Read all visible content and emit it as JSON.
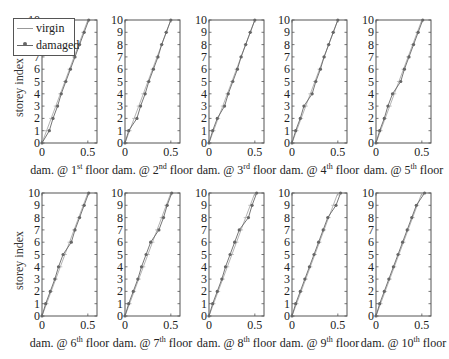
{
  "chart_data": [
    {
      "type": "line",
      "title": "",
      "xlabel": "dam. @ 1st floor",
      "xlabel_base": "dam. @ 1",
      "xlabel_sup": "st",
      "xlabel_tail": " floor",
      "ylabel": "storey index",
      "xlim": [
        0,
        0.6
      ],
      "ylim": [
        0,
        10
      ],
      "xticks": [
        "0",
        "0.5"
      ],
      "yticks": [
        "0",
        "1",
        "2",
        "3",
        "4",
        "5",
        "6",
        "7",
        "8",
        "9",
        "10"
      ],
      "series": [
        {
          "name": "virgin",
          "x": [
            0,
            0.05,
            0.1,
            0.15,
            0.2,
            0.25,
            0.3,
            0.35,
            0.4,
            0.45,
            0.5
          ],
          "y": [
            0,
            1,
            2,
            3,
            4,
            5,
            6,
            7,
            8,
            9,
            10
          ]
        },
        {
          "name": "damaged",
          "x": [
            0,
            0.08,
            0.12,
            0.17,
            0.21,
            0.26,
            0.31,
            0.36,
            0.41,
            0.46,
            0.51
          ],
          "y": [
            0,
            1,
            2,
            3,
            4,
            5,
            6,
            7,
            8,
            9,
            10
          ]
        }
      ]
    },
    {
      "type": "line",
      "xlabel": "dam. @ 2nd floor",
      "xlabel_base": "dam. @ 2",
      "xlabel_sup": "nd",
      "xlabel_tail": " floor",
      "ylabel": "",
      "xlim": [
        0,
        0.6
      ],
      "ylim": [
        0,
        10
      ],
      "xticks": [
        "0",
        "0.5"
      ],
      "yticks": [
        "0",
        "1",
        "2",
        "3",
        "4",
        "5",
        "6",
        "7",
        "8",
        "9",
        "10"
      ],
      "series": [
        {
          "name": "virgin",
          "x": [
            0,
            0.05,
            0.1,
            0.15,
            0.2,
            0.25,
            0.3,
            0.35,
            0.4,
            0.45,
            0.5
          ],
          "y": [
            0,
            1,
            2,
            3,
            4,
            5,
            6,
            7,
            8,
            9,
            10
          ]
        },
        {
          "name": "damaged",
          "x": [
            0,
            0.04,
            0.13,
            0.17,
            0.22,
            0.26,
            0.31,
            0.36,
            0.4,
            0.45,
            0.5
          ],
          "y": [
            0,
            1,
            2,
            3,
            4,
            5,
            6,
            7,
            8,
            9,
            10
          ]
        }
      ]
    },
    {
      "type": "line",
      "xlabel": "dam. @ 3rd floor",
      "xlabel_base": "dam. @ 3",
      "xlabel_sup": "rd",
      "xlabel_tail": " floor",
      "ylabel": "",
      "xlim": [
        0,
        0.6
      ],
      "ylim": [
        0,
        10
      ],
      "xticks": [
        "0",
        "0.5"
      ],
      "yticks": [
        "0",
        "1",
        "2",
        "3",
        "4",
        "5",
        "6",
        "7",
        "8",
        "9",
        "10"
      ],
      "series": [
        {
          "name": "virgin",
          "x": [
            0,
            0.05,
            0.1,
            0.15,
            0.2,
            0.25,
            0.3,
            0.35,
            0.4,
            0.45,
            0.5
          ],
          "y": [
            0,
            1,
            2,
            3,
            4,
            5,
            6,
            7,
            8,
            9,
            10
          ]
        },
        {
          "name": "damaged",
          "x": [
            0,
            0.04,
            0.09,
            0.17,
            0.21,
            0.26,
            0.31,
            0.35,
            0.4,
            0.45,
            0.5
          ],
          "y": [
            0,
            1,
            2,
            3,
            4,
            5,
            6,
            7,
            8,
            9,
            10
          ]
        }
      ]
    },
    {
      "type": "line",
      "xlabel": "dam. @ 4th floor",
      "xlabel_base": "dam. @ 4",
      "xlabel_sup": "th",
      "xlabel_tail": " floor",
      "ylabel": "",
      "xlim": [
        0,
        0.6
      ],
      "ylim": [
        0,
        10
      ],
      "xticks": [
        "0",
        "0.5"
      ],
      "yticks": [
        "0",
        "1",
        "2",
        "3",
        "4",
        "5",
        "6",
        "7",
        "8",
        "9",
        "10"
      ],
      "series": [
        {
          "name": "virgin",
          "x": [
            0,
            0.05,
            0.1,
            0.15,
            0.2,
            0.25,
            0.3,
            0.35,
            0.4,
            0.45,
            0.5
          ],
          "y": [
            0,
            1,
            2,
            3,
            4,
            5,
            6,
            7,
            8,
            9,
            10
          ]
        },
        {
          "name": "damaged",
          "x": [
            0,
            0.04,
            0.09,
            0.13,
            0.22,
            0.26,
            0.31,
            0.35,
            0.4,
            0.45,
            0.5
          ],
          "y": [
            0,
            1,
            2,
            3,
            4,
            5,
            6,
            7,
            8,
            9,
            10
          ]
        }
      ]
    },
    {
      "type": "line",
      "xlabel": "dam. @ 5th floor",
      "xlabel_base": "dam. @ 5",
      "xlabel_sup": "th",
      "xlabel_tail": " floor",
      "ylabel": "",
      "xlim": [
        0,
        0.6
      ],
      "ylim": [
        0,
        10
      ],
      "xticks": [
        "0",
        "0.5"
      ],
      "yticks": [
        "0",
        "1",
        "2",
        "3",
        "4",
        "5",
        "6",
        "7",
        "8",
        "9",
        "10"
      ],
      "series": [
        {
          "name": "virgin",
          "x": [
            0,
            0.05,
            0.1,
            0.15,
            0.2,
            0.25,
            0.3,
            0.35,
            0.4,
            0.45,
            0.5
          ],
          "y": [
            0,
            1,
            2,
            3,
            4,
            5,
            6,
            7,
            8,
            9,
            10
          ]
        },
        {
          "name": "damaged",
          "x": [
            0,
            0.04,
            0.09,
            0.13,
            0.18,
            0.27,
            0.31,
            0.36,
            0.41,
            0.46,
            0.51
          ],
          "y": [
            0,
            1,
            2,
            3,
            4,
            5,
            6,
            7,
            8,
            9,
            10
          ]
        }
      ]
    },
    {
      "type": "line",
      "xlabel": "dam. @ 6th floor",
      "xlabel_base": "dam. @ 6",
      "xlabel_sup": "th",
      "xlabel_tail": " floor",
      "ylabel": "storey index",
      "xlim": [
        0,
        0.6
      ],
      "ylim": [
        0,
        10
      ],
      "xticks": [
        "0",
        "0.5"
      ],
      "yticks": [
        "0",
        "1",
        "2",
        "3",
        "4",
        "5",
        "6",
        "7",
        "8",
        "9",
        "10"
      ],
      "series": [
        {
          "name": "virgin",
          "x": [
            0,
            0.05,
            0.1,
            0.15,
            0.2,
            0.25,
            0.3,
            0.35,
            0.4,
            0.45,
            0.5
          ],
          "y": [
            0,
            1,
            2,
            3,
            4,
            5,
            6,
            7,
            8,
            9,
            10
          ]
        },
        {
          "name": "damaged",
          "x": [
            0,
            0.04,
            0.09,
            0.14,
            0.18,
            0.23,
            0.32,
            0.36,
            0.41,
            0.46,
            0.51
          ],
          "y": [
            0,
            1,
            2,
            3,
            4,
            5,
            6,
            7,
            8,
            9,
            10
          ]
        }
      ]
    },
    {
      "type": "line",
      "xlabel": "dam. @ 7th floor",
      "xlabel_base": "dam. @ 7",
      "xlabel_sup": "th",
      "xlabel_tail": " floor",
      "ylabel": "",
      "xlim": [
        0,
        0.6
      ],
      "ylim": [
        0,
        10
      ],
      "xticks": [
        "0",
        "0.5"
      ],
      "yticks": [
        "0",
        "1",
        "2",
        "3",
        "4",
        "5",
        "6",
        "7",
        "8",
        "9",
        "10"
      ],
      "series": [
        {
          "name": "virgin",
          "x": [
            0,
            0.05,
            0.1,
            0.15,
            0.2,
            0.25,
            0.3,
            0.35,
            0.4,
            0.45,
            0.5
          ],
          "y": [
            0,
            1,
            2,
            3,
            4,
            5,
            6,
            7,
            8,
            9,
            10
          ]
        },
        {
          "name": "damaged",
          "x": [
            0,
            0.04,
            0.09,
            0.14,
            0.18,
            0.23,
            0.28,
            0.37,
            0.42,
            0.46,
            0.51
          ],
          "y": [
            0,
            1,
            2,
            3,
            4,
            5,
            6,
            7,
            8,
            9,
            10
          ]
        }
      ]
    },
    {
      "type": "line",
      "xlabel": "dam. @ 8th floor",
      "xlabel_base": "dam. @ 8",
      "xlabel_sup": "th",
      "xlabel_tail": " floor",
      "ylabel": "",
      "xlim": [
        0,
        0.6
      ],
      "ylim": [
        0,
        10
      ],
      "xticks": [
        "0",
        "0.5"
      ],
      "yticks": [
        "0",
        "1",
        "2",
        "3",
        "4",
        "5",
        "6",
        "7",
        "8",
        "9",
        "10"
      ],
      "series": [
        {
          "name": "virgin",
          "x": [
            0,
            0.05,
            0.1,
            0.15,
            0.2,
            0.25,
            0.3,
            0.35,
            0.4,
            0.45,
            0.5
          ],
          "y": [
            0,
            1,
            2,
            3,
            4,
            5,
            6,
            7,
            8,
            9,
            10
          ]
        },
        {
          "name": "damaged",
          "x": [
            0,
            0.04,
            0.09,
            0.14,
            0.18,
            0.23,
            0.28,
            0.33,
            0.43,
            0.47,
            0.52
          ],
          "y": [
            0,
            1,
            2,
            3,
            4,
            5,
            6,
            7,
            8,
            9,
            10
          ]
        }
      ]
    },
    {
      "type": "line",
      "xlabel": "dam. @ 9th floor",
      "xlabel_base": "dam. @ 9",
      "xlabel_sup": "th",
      "xlabel_tail": " floor",
      "ylabel": "",
      "xlim": [
        0,
        0.6
      ],
      "ylim": [
        0,
        10
      ],
      "xticks": [
        "0",
        "0.5"
      ],
      "yticks": [
        "0",
        "1",
        "2",
        "3",
        "4",
        "5",
        "6",
        "7",
        "8",
        "9",
        "10"
      ],
      "series": [
        {
          "name": "virgin",
          "x": [
            0,
            0.05,
            0.1,
            0.15,
            0.2,
            0.25,
            0.3,
            0.35,
            0.4,
            0.45,
            0.5
          ],
          "y": [
            0,
            1,
            2,
            3,
            4,
            5,
            6,
            7,
            8,
            9,
            10
          ]
        },
        {
          "name": "damaged",
          "x": [
            0,
            0.04,
            0.09,
            0.14,
            0.19,
            0.24,
            0.29,
            0.34,
            0.39,
            0.48,
            0.53
          ],
          "y": [
            0,
            1,
            2,
            3,
            4,
            5,
            6,
            7,
            8,
            9,
            10
          ]
        }
      ]
    },
    {
      "type": "line",
      "xlabel": "dam. @ 10th floor",
      "xlabel_base": "dam. @ 10",
      "xlabel_sup": "th",
      "xlabel_tail": " floor",
      "ylabel": "",
      "xlim": [
        0,
        0.6
      ],
      "ylim": [
        0,
        10
      ],
      "xticks": [
        "0",
        "0.5"
      ],
      "yticks": [
        "0",
        "1",
        "2",
        "3",
        "4",
        "5",
        "6",
        "7",
        "8",
        "9",
        "10"
      ],
      "series": [
        {
          "name": "virgin",
          "x": [
            0,
            0.05,
            0.1,
            0.15,
            0.2,
            0.25,
            0.3,
            0.35,
            0.4,
            0.45,
            0.5
          ],
          "y": [
            0,
            1,
            2,
            3,
            4,
            5,
            6,
            7,
            8,
            9,
            10
          ]
        },
        {
          "name": "damaged",
          "x": [
            0,
            0.04,
            0.09,
            0.14,
            0.19,
            0.24,
            0.29,
            0.34,
            0.39,
            0.44,
            0.53
          ],
          "y": [
            0,
            1,
            2,
            3,
            4,
            5,
            6,
            7,
            8,
            9,
            10
          ]
        }
      ]
    }
  ],
  "legend": {
    "items": [
      {
        "label": "virgin",
        "color": "#999999"
      },
      {
        "label": "damaged",
        "color": "#666666",
        "marker": "dot"
      }
    ]
  },
  "ylabel_text": "storey index",
  "layout": {
    "panels": [
      {
        "left": 42,
        "top": 20
      },
      {
        "left": 125,
        "top": 20
      },
      {
        "left": 209,
        "top": 20
      },
      {
        "left": 292,
        "top": 20
      },
      {
        "left": 376,
        "top": 20
      },
      {
        "left": 42,
        "top": 193
      },
      {
        "left": 125,
        "top": 193
      },
      {
        "left": 209,
        "top": 193
      },
      {
        "left": 292,
        "top": 193
      },
      {
        "left": 376,
        "top": 193
      }
    ],
    "width": 55,
    "height": 123,
    "colors": {
      "axis": "#555555",
      "virgin": "#aaaaaa",
      "damaged": "#666666",
      "text": "#222222"
    }
  }
}
